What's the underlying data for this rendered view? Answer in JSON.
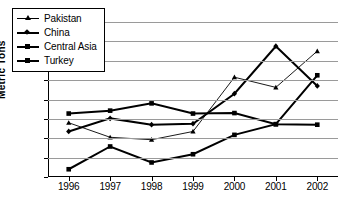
{
  "chart_data": {
    "type": "line",
    "title": "",
    "xlabel": "",
    "ylabel": "Metric Tons",
    "categories": [
      "1996",
      "1997",
      "1998",
      "1999",
      "2000",
      "2001",
      "2002"
    ],
    "ylim": [
      0,
      16
    ],
    "yticks": [
      0,
      2,
      4,
      6,
      8,
      10,
      12,
      14,
      16
    ],
    "grid": true,
    "legend_position": "top-left",
    "series": [
      {
        "name": "Pakistan",
        "values": [
          5.6,
          4.1,
          3.85,
          4.7,
          10.3,
          9.25,
          13.0
        ],
        "marker": "triangle",
        "line": "thin"
      },
      {
        "name": "China",
        "values": [
          4.7,
          6.05,
          5.4,
          5.5,
          8.6,
          13.5,
          9.4
        ],
        "marker": "diamond",
        "line": "thick"
      },
      {
        "name": "Central Asia",
        "values": [
          6.55,
          6.85,
          7.6,
          6.55,
          6.6,
          5.45,
          5.4
        ],
        "marker": "square",
        "line": "thick"
      },
      {
        "name": "Turkey",
        "values": [
          0.8,
          3.15,
          1.5,
          2.35,
          4.35,
          5.45,
          10.5
        ],
        "marker": "square",
        "line": "thick"
      }
    ]
  },
  "colors": {
    "series_line": "#000000",
    "gridline": "#9a9a9a",
    "axis": "#000000",
    "background": "#ffffff"
  }
}
